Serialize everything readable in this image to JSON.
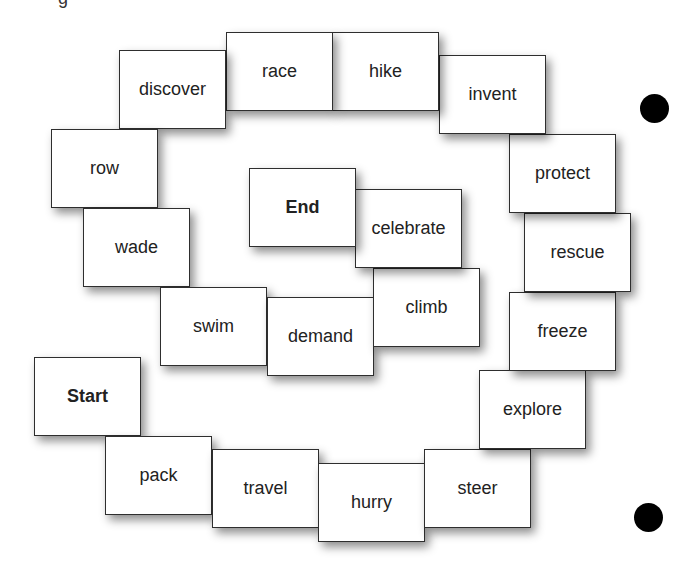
{
  "board": {
    "title_fragment": "g",
    "cards": [
      {
        "label": "Start",
        "x": 34,
        "y": 357,
        "bold": true
      },
      {
        "label": "pack",
        "x": 105,
        "y": 436
      },
      {
        "label": "travel",
        "x": 212,
        "y": 449
      },
      {
        "label": "hurry",
        "x": 318,
        "y": 463
      },
      {
        "label": "steer",
        "x": 424,
        "y": 449
      },
      {
        "label": "explore",
        "x": 479,
        "y": 370
      },
      {
        "label": "freeze",
        "x": 509,
        "y": 292
      },
      {
        "label": "rescue",
        "x": 524,
        "y": 213
      },
      {
        "label": "protect",
        "x": 509,
        "y": 134
      },
      {
        "label": "invent",
        "x": 439,
        "y": 55
      },
      {
        "label": "hike",
        "x": 332,
        "y": 32
      },
      {
        "label": "race",
        "x": 226,
        "y": 32
      },
      {
        "label": "discover",
        "x": 119,
        "y": 50
      },
      {
        "label": "row",
        "x": 51,
        "y": 129
      },
      {
        "label": "wade",
        "x": 83,
        "y": 208
      },
      {
        "label": "swim",
        "x": 160,
        "y": 287
      },
      {
        "label": "demand",
        "x": 267,
        "y": 297
      },
      {
        "label": "climb",
        "x": 373,
        "y": 268
      },
      {
        "label": "celebrate",
        "x": 355,
        "y": 189
      },
      {
        "label": "End",
        "x": 249,
        "y": 168,
        "bold": true
      }
    ],
    "dots": [
      {
        "x": 640,
        "y": 94
      },
      {
        "x": 634,
        "y": 503
      }
    ]
  }
}
